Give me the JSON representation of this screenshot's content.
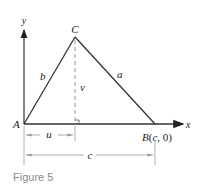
{
  "figure": {
    "caption": "Figure 5",
    "axes": {
      "x_label": "x",
      "y_label": "y"
    },
    "vertices": {
      "A": {
        "label": "A"
      },
      "B": {
        "label": "B",
        "coords": "(c, 0)",
        "coord_c": "c",
        "coord_0": "0"
      },
      "C": {
        "label": "C"
      }
    },
    "sides": {
      "a": "a",
      "b": "b"
    },
    "height_label": "v",
    "dimensions": {
      "u": "u",
      "c": "c"
    },
    "colors": {
      "line": "#333333",
      "dashed": "#9a9a9a",
      "dimension": "#9a9a9a",
      "caption": "#8a8a8a"
    }
  }
}
